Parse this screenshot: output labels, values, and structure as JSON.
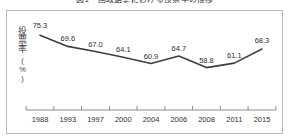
{
  "figure": {
    "caption": "図1　国政選挙における投票率の推移",
    "frame_color": "#b9b9b9",
    "background": "#ffffff"
  },
  "axis": {
    "y_title": "投票率",
    "y_unit": "(%)",
    "axis_line_color": "#8c8c8c",
    "tick_color": "#8c8c8c"
  },
  "chart_data": {
    "type": "line",
    "title": "図1　国政選挙における投票率の推移",
    "xlabel": "",
    "ylabel": "投票率（%）",
    "categories": [
      "1988",
      "1993",
      "1997",
      "2000",
      "2004",
      "2006",
      "2008",
      "2011",
      "2015"
    ],
    "values": [
      75.3,
      69.6,
      67.0,
      64.1,
      60.9,
      64.7,
      58.8,
      61.1,
      68.3
    ],
    "data_labels": [
      "75.3",
      "69.6",
      "67.0",
      "64.1",
      "60.9",
      "64.7",
      "58.8",
      "61.1",
      "68.3"
    ],
    "ylim": [
      55,
      78
    ],
    "grid": false,
    "legend": null,
    "series_color": "#3f3f3f",
    "line_width": 1.6,
    "markers": false
  }
}
